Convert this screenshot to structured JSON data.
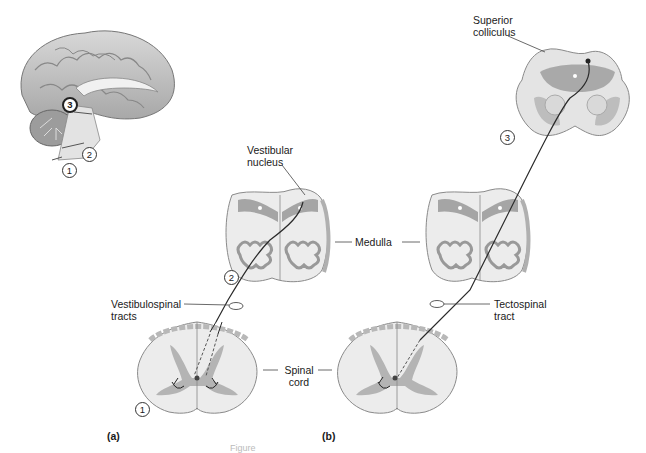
{
  "figure": {
    "panels": [
      {
        "id": "a",
        "label": "(a)"
      },
      {
        "id": "b",
        "label": "(b)"
      }
    ],
    "labels": {
      "superior_colliculus": [
        "Superior",
        "colliculus"
      ],
      "vestibular_nucleus": [
        "Vestibular",
        "nucleus"
      ],
      "medulla": "Medulla",
      "vestibulospinal_tracts": [
        "Vestibulospinal",
        "tracts"
      ],
      "tectospinal_tract": [
        "Tectospinal",
        "tract"
      ],
      "spinal_cord": [
        "Spinal",
        "cord"
      ]
    },
    "markers": {
      "brain_3": "3",
      "brain_2": "2",
      "brain_1": "1",
      "medulla_a_2": "2",
      "spinal_a_1": "1",
      "colliculus_b_3": "3"
    },
    "caption_fragment": "Figure"
  },
  "colors": {
    "tissue_light": "#ececec",
    "tissue_mid": "#cfcfcf",
    "tissue_dark": "#9a9a9a",
    "gray_matter": "#b3b3b3",
    "edge": "#7a7a7a",
    "pathway": "#2a2a2a"
  }
}
